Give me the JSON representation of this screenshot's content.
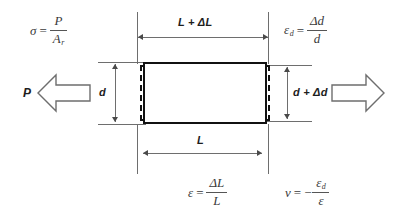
{
  "diagram": {
    "colors": {
      "specimen_outline": "#111111",
      "dimension_line": "#6e6e6e",
      "formula_text": "#3a3a3a",
      "label_text": "#1d1d1d",
      "background": "#ffffff"
    }
  },
  "formulas": {
    "stress": {
      "id": "stress-definition",
      "lhs": "σ",
      "equals": "=",
      "numerator": "P",
      "denominator": "A",
      "denominator_subscript": "r",
      "plain": "σ = P / A_r"
    },
    "diameter_strain": {
      "id": "diameter-strain-definition",
      "lhs": "ε",
      "lhs_subscript": "d",
      "equals": "=",
      "numerator": "Δd",
      "denominator": "d",
      "plain": "ε_d = Δd / d"
    },
    "axial_strain": {
      "id": "axial-strain-definition",
      "lhs": "ε",
      "equals": "=",
      "numerator": "ΔL",
      "denominator": "L",
      "plain": "ε = ΔL / L"
    },
    "poisson": {
      "id": "poisson-ratio-definition",
      "lhs": "ν",
      "equals": "=",
      "sign": "−",
      "numerator": "ε",
      "numerator_subscript": "d",
      "denominator": "ε",
      "plain": "ν = − ε_d / ε"
    }
  },
  "dimensions": {
    "deformed_length": "L + ΔL",
    "original_length": "L",
    "original_diameter": "d",
    "deformed_diameter": "d + Δd"
  },
  "loads": {
    "left_label": "P",
    "right_label": ""
  },
  "icons": {
    "left_load_arrow": "block-arrow-left-icon",
    "right_load_arrow": "block-arrow-right-icon"
  }
}
